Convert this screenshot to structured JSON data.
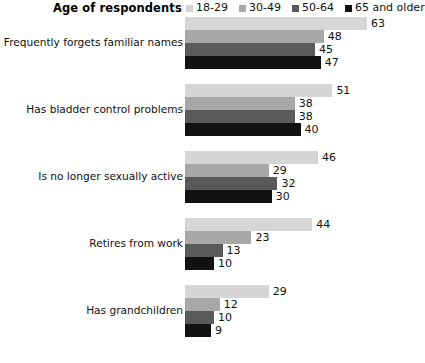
{
  "header": {
    "title": "Age of respondents"
  },
  "chart_data": {
    "type": "bar",
    "orientation": "horizontal",
    "title": "Age of respondents",
    "xlabel": "",
    "ylabel": "",
    "grid": false,
    "legend_position": "top-right",
    "xlim": [
      0,
      63
    ],
    "px_per_unit": 2.89,
    "categories": [
      "Frequently forgets familiar names",
      "Has bladder control problems",
      "Is no longer sexually active",
      "Retires from work",
      "Has grandchildren"
    ],
    "series": [
      {
        "name": "18-29",
        "color": "#d6d6d6",
        "values": [
          63,
          51,
          46,
          44,
          29
        ]
      },
      {
        "name": "30-49",
        "color": "#a8a8a8",
        "values": [
          48,
          38,
          29,
          23,
          12
        ]
      },
      {
        "name": "50-64",
        "color": "#5a5a5a",
        "values": [
          45,
          38,
          32,
          13,
          10
        ]
      },
      {
        "name": "65 and older",
        "color": "#121212",
        "values": [
          47,
          40,
          30,
          10,
          9
        ]
      }
    ]
  },
  "footer": {
    "source": ""
  }
}
